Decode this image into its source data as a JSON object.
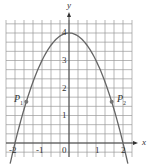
{
  "chart_data": {
    "type": "line",
    "title": "",
    "xlabel": "x",
    "ylabel": "y",
    "function": "y = 4 - x^2",
    "xlim": [
      -2.33,
      2.33
    ],
    "ylim": [
      -0.5,
      4.5
    ],
    "grid": true,
    "grid_step": 0.333,
    "x_ticks": [
      "-2",
      "-1",
      "0",
      "1",
      "2"
    ],
    "y_ticks": [
      "1",
      "2",
      "3",
      "4"
    ],
    "series": [
      {
        "name": "parabola",
        "x": [
          -2,
          -1.5,
          -1,
          -0.5,
          0,
          0.5,
          1,
          1.5,
          2
        ],
        "y": [
          0,
          1.75,
          3,
          3.75,
          4,
          3.75,
          3,
          1.75,
          0
        ]
      }
    ],
    "points": [
      {
        "label": "P1",
        "x": -1.58,
        "y": 1.5
      },
      {
        "label": "P2",
        "x": 1.58,
        "y": 1.5
      }
    ],
    "colors": {
      "curve": "#666666",
      "grid": "#9a9a9a",
      "axis": "#333333",
      "point": "#777777"
    }
  },
  "labels": {
    "x_axis": "x",
    "y_axis": "y",
    "p1": "P",
    "p1_sub": "1",
    "p2": "P",
    "p2_sub": "2",
    "xt": [
      "-2",
      "-1",
      "0",
      "1",
      "2"
    ],
    "yt": [
      "1",
      "2",
      "3",
      "4"
    ]
  }
}
